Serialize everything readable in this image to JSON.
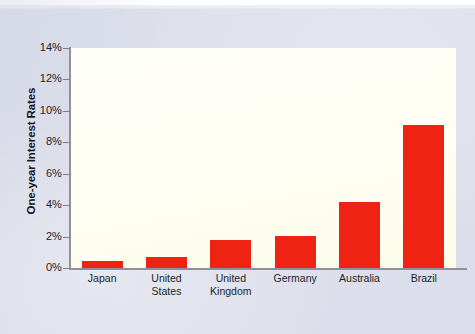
{
  "chart_data": {
    "type": "bar",
    "title": "",
    "subtitle": "",
    "xlabel": "",
    "ylabel": "One-year Interest Rates",
    "categories": [
      "Japan",
      "United States",
      "United Kingdom",
      "Germany",
      "Australia",
      "Brazil"
    ],
    "category_lines": [
      [
        "Japan"
      ],
      [
        "United",
        "States"
      ],
      [
        "United",
        "Kingdom"
      ],
      [
        "Germany"
      ],
      [
        "Australia"
      ],
      [
        "Brazil"
      ]
    ],
    "values": [
      0.45,
      0.7,
      1.8,
      2.05,
      4.2,
      9.1
    ],
    "value_unit": "%",
    "ylim": [
      0,
      14
    ],
    "ytick_values": [
      0,
      2,
      4,
      6,
      8,
      10,
      12,
      14
    ],
    "ytick_labels": [
      "0%",
      "2%",
      "4%",
      "6%",
      "8%",
      "10%",
      "12%",
      "14%"
    ],
    "grid": false,
    "legend": false,
    "legend_position": "none",
    "bar_color": "#ee2311",
    "plot_background": "#fffff4",
    "page_background": "#dcdfeb",
    "axis_color": "#8f9098"
  }
}
